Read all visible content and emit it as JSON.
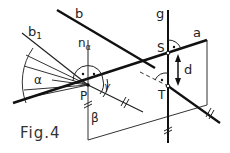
{
  "figure": {
    "caption": "Fig.4",
    "colors": {
      "line": "#111111",
      "thin": "#333333",
      "background": "#ffffff"
    }
  },
  "labels": {
    "line_b": "b",
    "line_b1": "b",
    "line_b1_sub": "1",
    "normal": "n",
    "normal_sub": "α",
    "angle_alpha": "α",
    "angle_gamma": "γ",
    "point_P": "P",
    "point_S": "S",
    "point_T": "T",
    "line_g": "g",
    "line_a": "a",
    "distance_d": "d",
    "plane_beta": "β"
  }
}
